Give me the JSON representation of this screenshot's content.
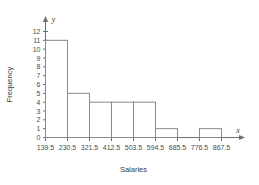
{
  "chart_data": {
    "type": "bar",
    "title": "",
    "xlabel": "Salaries",
    "ylabel": "Frequency",
    "x_axis_symbol": "x",
    "y_axis_symbol": "y",
    "bin_edges": [
      139.5,
      230.5,
      321.5,
      412.5,
      503.5,
      594.5,
      685.5,
      776.5,
      867.5
    ],
    "categories": [
      "139.5-230.5",
      "230.5-321.5",
      "321.5-412.5",
      "412.5-503.5",
      "503.5-594.5",
      "594.5-685.5",
      "685.5-776.5",
      "776.5-867.5"
    ],
    "values": [
      11,
      5,
      4,
      4,
      4,
      1,
      0,
      1
    ],
    "xtick_labels": [
      "139.5",
      "230.5",
      "321.5",
      "412.5",
      "503.5",
      "594.5",
      "685.5",
      "776.5",
      "867.5"
    ],
    "ytick_labels": [
      "0",
      "1",
      "2",
      "3",
      "4",
      "5",
      "6",
      "7",
      "8",
      "9",
      "10",
      "11",
      "12"
    ],
    "ylim": [
      0,
      12
    ],
    "xlim": [
      139.5,
      867.5
    ],
    "grid": false,
    "legend": null,
    "bar_fill": "#ffffff",
    "bar_stroke": "#8a8a8a",
    "axis_color": "#6e6e6e",
    "text_color": "#4a4a4a",
    "background": "#ffffff"
  }
}
